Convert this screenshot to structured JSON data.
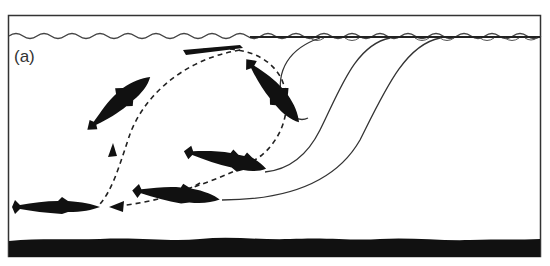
{
  "figure": {
    "panel_label": "(a)",
    "elements": {
      "water_surface": "wavy-line",
      "substrate": "dark-bottom",
      "fish_count": 5,
      "solid_paths": 3,
      "dashed_path_arrows": 2
    },
    "colors": {
      "ink": "#111111",
      "line": "#333333",
      "background": "#ffffff"
    }
  }
}
